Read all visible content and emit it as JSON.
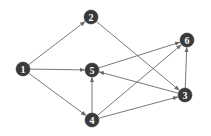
{
  "diagram": {
    "type": "directed-graph",
    "node_color": "#3a3a3a",
    "edge_color": "#6a6a6a",
    "label_color": "#ffffff",
    "nodes": [
      {
        "id": "1",
        "label": "1",
        "x": 23,
        "y": 69
      },
      {
        "id": "2",
        "label": "2",
        "x": 91,
        "y": 17
      },
      {
        "id": "3",
        "label": "3",
        "x": 185,
        "y": 95
      },
      {
        "id": "4",
        "label": "4",
        "x": 92,
        "y": 120
      },
      {
        "id": "5",
        "label": "5",
        "x": 92,
        "y": 70
      },
      {
        "id": "6",
        "label": "6",
        "x": 187,
        "y": 40
      }
    ],
    "edges": [
      {
        "from": "1",
        "to": "2"
      },
      {
        "from": "1",
        "to": "5"
      },
      {
        "from": "1",
        "to": "4"
      },
      {
        "from": "2",
        "to": "3"
      },
      {
        "from": "5",
        "to": "6"
      },
      {
        "from": "3",
        "to": "5"
      },
      {
        "from": "3",
        "to": "6"
      },
      {
        "from": "4",
        "to": "5"
      },
      {
        "from": "4",
        "to": "6"
      },
      {
        "from": "4",
        "to": "3"
      }
    ]
  }
}
